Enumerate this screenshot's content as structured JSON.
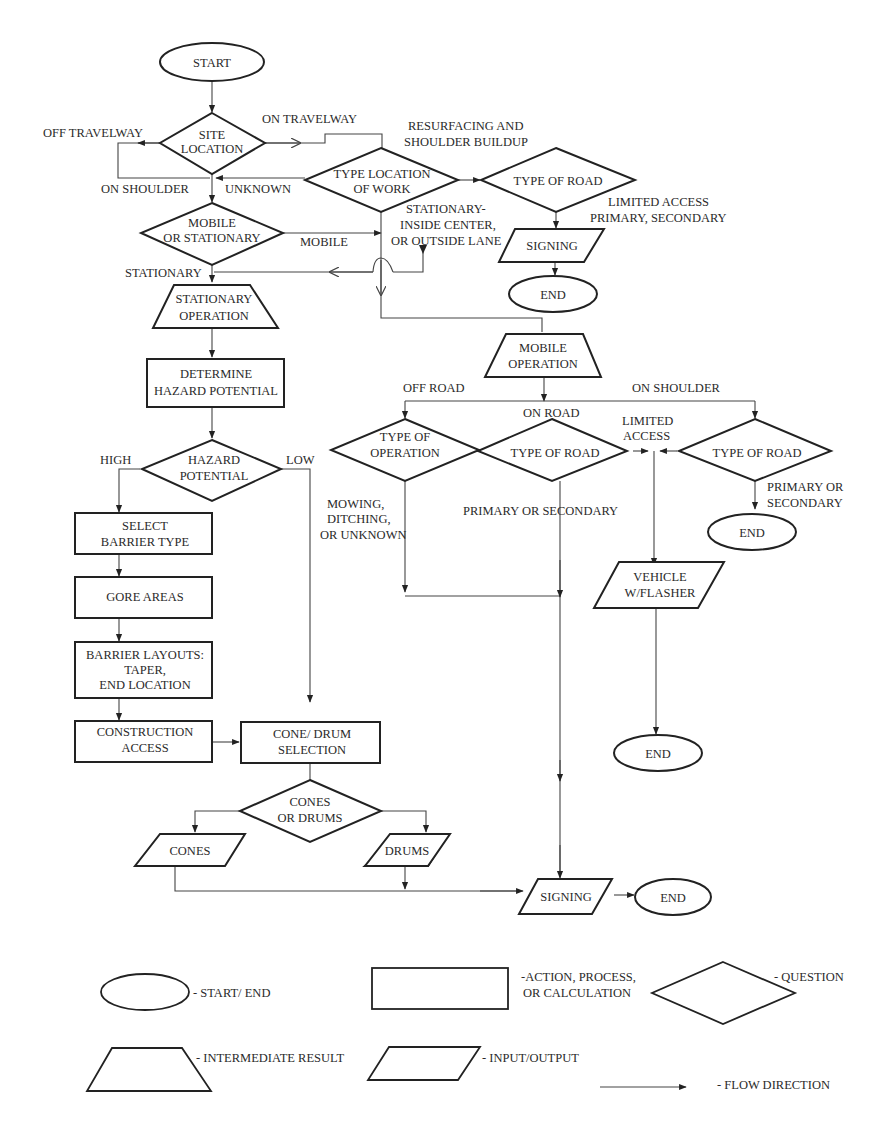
{
  "colors": {
    "stroke": "#222222",
    "line": "#444444",
    "text": "#2a2a2a",
    "background": "#ffffff"
  },
  "nodes": {
    "start": "START",
    "site_location": [
      "SITE",
      "LOCATION"
    ],
    "mobile_or_stationary": [
      "MOBILE",
      "OR STATIONARY"
    ],
    "type_location_of_work": [
      "TYPE LOCATION",
      "OF WORK"
    ],
    "type_of_road_top": "TYPE OF ROAD",
    "signing_top": "SIGNING",
    "end_top": "END",
    "stationary_operation": [
      "STATIONARY",
      "OPERATION"
    ],
    "determine_hazard": [
      "DETERMINE",
      "HAZARD POTENTIAL"
    ],
    "hazard_potential": [
      "HAZARD",
      "POTENTIAL"
    ],
    "select_barrier": [
      "SELECT",
      "BARRIER TYPE"
    ],
    "gore_areas": "GORE AREAS",
    "barrier_layouts": [
      "BARRIER LAYOUTS:",
      "TAPER,",
      "END LOCATION"
    ],
    "construction_access": [
      "CONSTRUCTION",
      "ACCESS"
    ],
    "cone_drum_selection": [
      "CONE/ DRUM",
      "SELECTION"
    ],
    "cones_or_drums": [
      "CONES",
      "OR DRUMS"
    ],
    "cones": "CONES",
    "drums": "DRUMS",
    "mobile_operation": [
      "MOBILE",
      "OPERATION"
    ],
    "type_of_operation": [
      "TYPE OF",
      "OPERATION"
    ],
    "type_of_road_onroad": "TYPE OF ROAD",
    "type_of_road_shoulder": "TYPE OF ROAD",
    "end_shoulder": "END",
    "vehicle_flasher": [
      "VEHICLE",
      "W/FLASHER"
    ],
    "end_vehicle": "END",
    "signing_bottom": "SIGNING",
    "end_bottom": "END"
  },
  "labels": {
    "off_travelway": "OFF TRAVELWAY",
    "on_travelway": "ON TRAVELWAY",
    "on_shoulder": "ON SHOULDER",
    "unknown": "UNKNOWN",
    "resurfacing": [
      "RESURFACING AND",
      "SHOULDER BUILDUP"
    ],
    "limited_primary": [
      "LIMITED ACCESS",
      "PRIMARY, SECONDARY"
    ],
    "stationary_lane": [
      "STATIONARY-",
      "INSIDE CENTER,",
      "OR OUTSIDE LANE"
    ],
    "mobile": "MOBILE",
    "stationary": "STATIONARY",
    "high": "HIGH",
    "low": "LOW",
    "off_road": "OFF ROAD",
    "on_road": "ON ROAD",
    "on_shoulder_mobile": "ON SHOULDER",
    "limited_access": [
      "LIMITED",
      "ACCESS"
    ],
    "mowing": [
      "MOWING,",
      "DITCHING,",
      "OR UNKNOWN"
    ],
    "primary_or_secondary": "PRIMARY OR SECONDARY",
    "primary_or_secondary_2": [
      "PRIMARY OR",
      "SECONDARY"
    ]
  },
  "legend": {
    "start_end": "- START/ END",
    "action": [
      "-ACTION, PROCESS,",
      "OR CALCULATION"
    ],
    "question": "- QUESTION",
    "intermediate": "- INTERMEDIATE RESULT",
    "input_output": "- INPUT/OUTPUT",
    "flow": "- FLOW DIRECTION"
  }
}
